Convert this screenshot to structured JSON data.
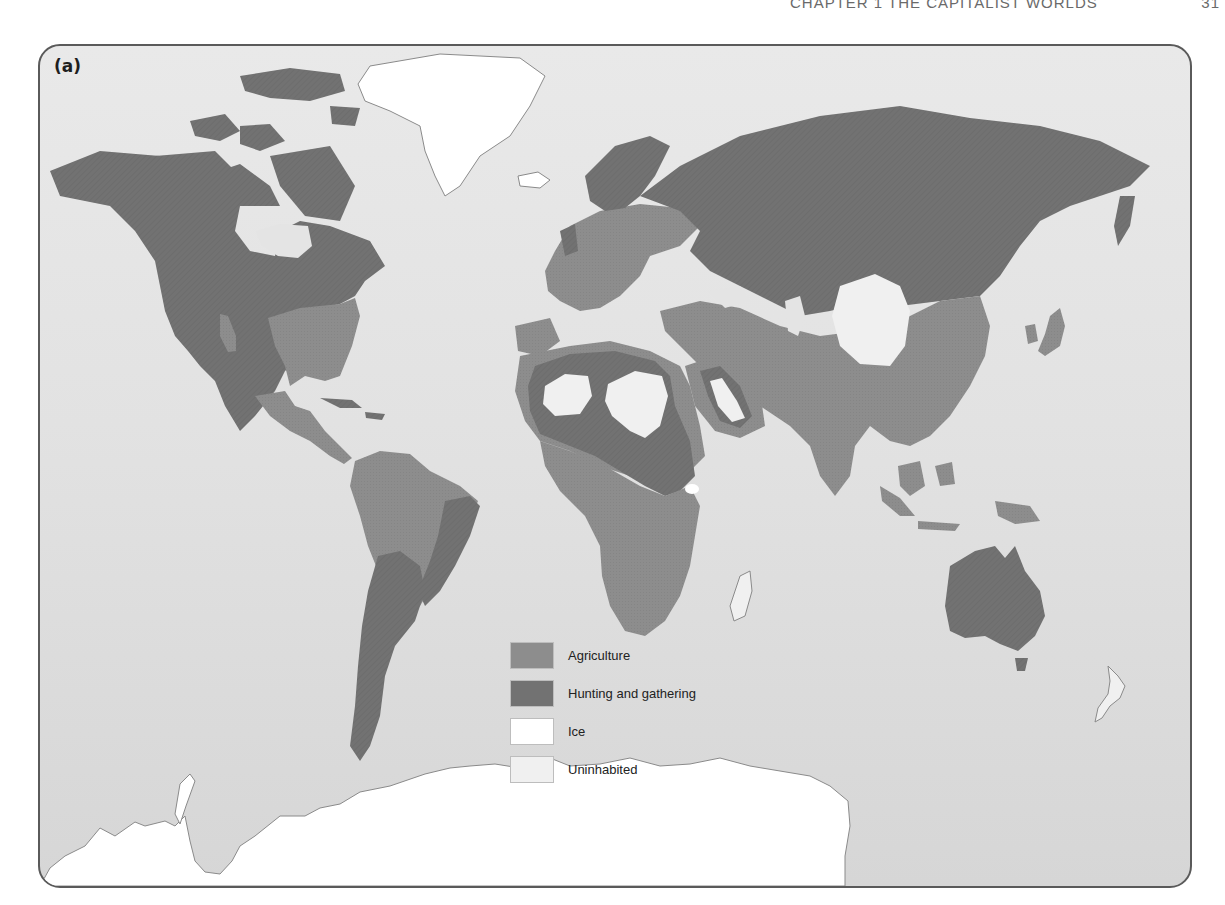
{
  "page": {
    "running_header": "Chapter 1 The Capitalist Worlds",
    "page_number": "31"
  },
  "figure": {
    "panel_label": "(a)",
    "colors": {
      "ocean": "#e4e4e4",
      "agriculture": "#8d8d8d",
      "hunting_gathering": "#727272",
      "ice": "#ffffff",
      "uninhabited": "#f0f0f0",
      "coastline": "#8a8a8a",
      "frame_border": "#5a5a5a"
    },
    "legend": {
      "items": [
        {
          "key": "agriculture",
          "label": "Agriculture",
          "color": "#8d8d8d"
        },
        {
          "key": "hunting_gathering",
          "label": "Hunting and gathering",
          "color": "#727272"
        },
        {
          "key": "ice",
          "label": "Ice",
          "color": "#ffffff"
        },
        {
          "key": "uninhabited",
          "label": "Uninhabited",
          "color": "#f0f0f0"
        }
      ]
    }
  }
}
